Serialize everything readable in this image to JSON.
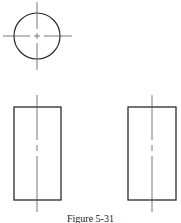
{
  "figure": {
    "caption": "Figure 5-31",
    "stroke_color": "#2a2a2a",
    "centerline_color": "#555555"
  },
  "views": {
    "top_view": {
      "shape": "circle",
      "cx": 37,
      "cy": 36,
      "r": 23
    },
    "front_view": {
      "shape": "rectangle",
      "x": 14,
      "y": 107,
      "width": 47,
      "height": 93,
      "centerline_x": 37
    },
    "side_view": {
      "shape": "rectangle",
      "x": 128,
      "y": 107,
      "width": 48,
      "height": 93,
      "centerline_x": 152
    }
  }
}
